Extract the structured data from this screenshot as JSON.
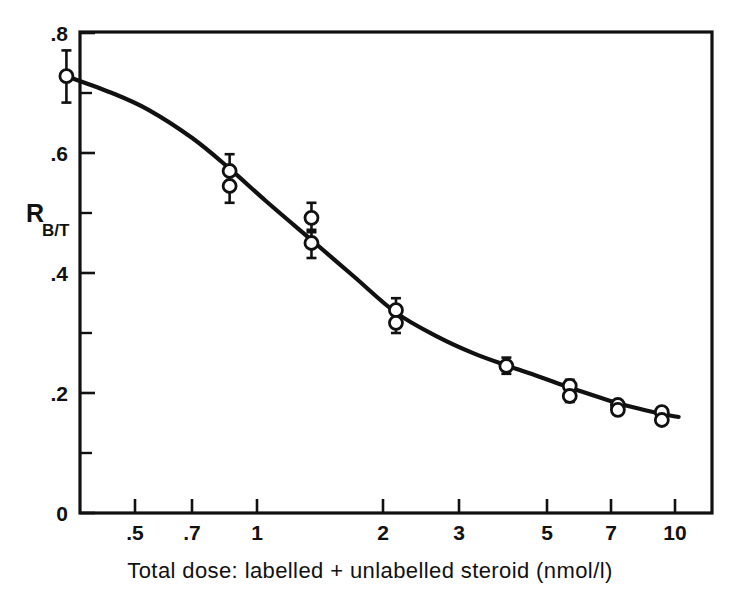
{
  "figure": {
    "background": "#ffffff",
    "ink_color": "#111111"
  },
  "axes": {
    "y": {
      "label_main": "R",
      "label_sub": "B/T",
      "tick_labels": [
        "0",
        ".2",
        ".4",
        ".6",
        ".8"
      ],
      "tick_values": [
        0,
        0.2,
        0.4,
        0.6,
        0.8
      ],
      "minor_tick_values": [
        0.1,
        0.3,
        0.5,
        0.7
      ],
      "range": [
        0,
        0.8
      ],
      "scale": "linear"
    },
    "x": {
      "caption": "Total dose: labelled + unlabelled steroid   (nmol/l)",
      "tick_labels": [
        ".5",
        ".7",
        "1",
        "2",
        "3",
        "5",
        "7",
        "10"
      ],
      "tick_values": [
        0.5,
        0.7,
        1,
        2,
        3,
        5,
        7,
        10
      ],
      "range": [
        0.33,
        12.0
      ],
      "scale": "log"
    }
  },
  "chart_data": {
    "type": "scatter",
    "title": "",
    "xlabel": "Total dose: labelled + unlabelled steroid   (nmol/l)",
    "ylabel": "R B/T",
    "xscale": "log",
    "yscale": "linear",
    "xlim": [
      0.33,
      12.0
    ],
    "ylim": [
      0,
      0.8
    ],
    "grid": false,
    "legend": "none",
    "marker_style": "open-circle",
    "error_bars": "vertical",
    "points": [
      {
        "x": 0.35,
        "y": 0.728,
        "yerr_low": 0.044,
        "yerr_high": 0.043
      },
      {
        "x": 0.86,
        "y": 0.57,
        "yerr_low": 0.022,
        "yerr_high": 0.028
      },
      {
        "x": 0.86,
        "y": 0.545,
        "yerr_low": 0.028,
        "yerr_high": 0.02
      },
      {
        "x": 1.35,
        "y": 0.492,
        "yerr_low": 0.02,
        "yerr_high": 0.025
      },
      {
        "x": 1.35,
        "y": 0.45,
        "yerr_low": 0.025,
        "yerr_high": 0.018
      },
      {
        "x": 2.15,
        "y": 0.338,
        "yerr_low": 0.014,
        "yerr_high": 0.02
      },
      {
        "x": 2.15,
        "y": 0.317,
        "yerr_low": 0.017,
        "yerr_high": 0.013
      },
      {
        "x": 3.95,
        "y": 0.245,
        "yerr_low": 0.013,
        "yerr_high": 0.014
      },
      {
        "x": 5.6,
        "y": 0.212,
        "yerr_low": 0.01,
        "yerr_high": 0.01
      },
      {
        "x": 5.6,
        "y": 0.195,
        "yerr_low": 0.01,
        "yerr_high": 0.008
      },
      {
        "x": 7.3,
        "y": 0.18,
        "yerr_low": 0.01,
        "yerr_high": 0.008
      },
      {
        "x": 7.3,
        "y": 0.172,
        "yerr_low": 0.008,
        "yerr_high": 0.007
      },
      {
        "x": 9.3,
        "y": 0.168,
        "yerr_low": 0.006,
        "yerr_high": 0.006
      },
      {
        "x": 9.3,
        "y": 0.155,
        "yerr_low": 0.006,
        "yerr_high": 0.006
      }
    ],
    "fitted_curve": [
      {
        "x": 0.35,
        "y": 0.728
      },
      {
        "x": 0.45,
        "y": 0.7
      },
      {
        "x": 0.55,
        "y": 0.672
      },
      {
        "x": 0.7,
        "y": 0.625
      },
      {
        "x": 0.86,
        "y": 0.574
      },
      {
        "x": 1.05,
        "y": 0.52
      },
      {
        "x": 1.35,
        "y": 0.455
      },
      {
        "x": 1.7,
        "y": 0.395
      },
      {
        "x": 2.15,
        "y": 0.334
      },
      {
        "x": 2.7,
        "y": 0.294
      },
      {
        "x": 3.3,
        "y": 0.266
      },
      {
        "x": 3.95,
        "y": 0.246
      },
      {
        "x": 4.7,
        "y": 0.228
      },
      {
        "x": 5.6,
        "y": 0.209
      },
      {
        "x": 6.5,
        "y": 0.194
      },
      {
        "x": 7.3,
        "y": 0.183
      },
      {
        "x": 8.3,
        "y": 0.173
      },
      {
        "x": 9.3,
        "y": 0.165
      },
      {
        "x": 10.2,
        "y": 0.16
      }
    ]
  }
}
